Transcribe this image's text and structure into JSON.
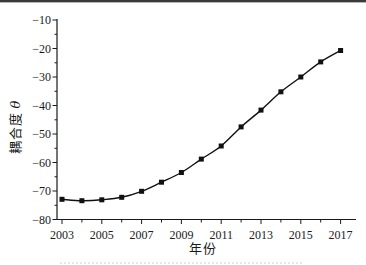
{
  "figure": {
    "has_top_border": true,
    "background": "#ffffff"
  },
  "chart_data": {
    "type": "line",
    "title": "",
    "xlabel": "年份",
    "ylabel": "耦合度 θ",
    "ylabel_text": "耦合度",
    "ylabel_symbol": "θ",
    "x": [
      2003,
      2004,
      2005,
      2006,
      2007,
      2008,
      2009,
      2010,
      2011,
      2012,
      2013,
      2014,
      2015,
      2016,
      2017
    ],
    "values": [
      -72.9,
      -73.4,
      -73.1,
      -72.2,
      -70.1,
      -66.9,
      -63.5,
      -58.8,
      -54.2,
      -47.5,
      -41.6,
      -35.2,
      -30.0,
      -24.7,
      -20.7
    ],
    "xlim": [
      2003,
      2017
    ],
    "ylim": [
      -80,
      -10
    ],
    "ytick_step_major": 10,
    "ytick_step_minor": 5,
    "xtick_label_step": 2,
    "xtick_minor_step": 1,
    "xtick_labels": [
      "2003",
      "2005",
      "2007",
      "2009",
      "2011",
      "2013",
      "2015",
      "2017"
    ],
    "ytick_labels": [
      "−10",
      "−20",
      "−30",
      "−40",
      "−50",
      "−60",
      "−70",
      "−80"
    ],
    "grid": false,
    "legend": "none",
    "marker": "filled-square",
    "line_color": "#111111",
    "marker_color": "#111111",
    "axis_color": "#1a1a1a"
  }
}
